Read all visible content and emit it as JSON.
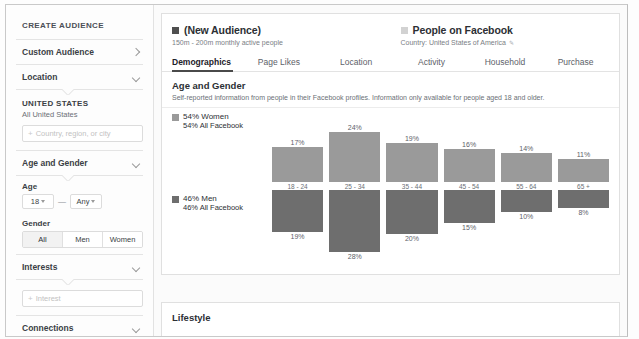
{
  "sidebar": {
    "title": "CREATE AUDIENCE",
    "accordions": [
      {
        "label": "Custom Audience",
        "icon": "chevron-right-icon"
      },
      {
        "label": "Location",
        "icon": "chevron-down-icon"
      }
    ],
    "location": {
      "heading": "UNITED STATES",
      "subtext": "All United States",
      "input_placeholder": "Country, region, or city",
      "add_icon": "plus-icon"
    },
    "age_gender": {
      "label": "Age and Gender",
      "icon": "chevron-down-icon",
      "age_label": "Age",
      "age_min": "18",
      "age_max": "Any",
      "age_separator": "—",
      "gender_label": "Gender",
      "gender_options": [
        "All",
        "Men",
        "Women"
      ],
      "gender_selected": "All"
    },
    "interests": {
      "label": "Interests",
      "icon": "chevron-down-icon",
      "input_placeholder": "Interest",
      "add_icon": "plus-icon"
    },
    "connections": {
      "label": "Connections",
      "icon": "chevron-down-icon"
    },
    "pages": {
      "label": "Pages",
      "icon": "chevron-down-icon"
    }
  },
  "header": {
    "audience": {
      "name": "(New Audience)",
      "subtitle": "150m - 200m monthly active people",
      "swatch_color": "#4f4f4f"
    },
    "comparison": {
      "name": "People on Facebook",
      "subtitle": "Country: United States of America",
      "edit_icon": "pencil-icon",
      "swatch_color": "#d2d2d2"
    }
  },
  "tabs": [
    {
      "label": "Demographics",
      "active": true
    },
    {
      "label": "Page Likes",
      "active": false
    },
    {
      "label": "Location",
      "active": false
    },
    {
      "label": "Activity",
      "active": false
    },
    {
      "label": "Household",
      "active": false
    },
    {
      "label": "Purchase",
      "active": false
    }
  ],
  "section": {
    "title": "Age and Gender",
    "description": "Self-reported information from people in their Facebook profiles. Information only available for people aged 18 and older."
  },
  "legend": {
    "women": {
      "main": "54% Women",
      "sub": "54% All Facebook",
      "color": "#9a9a9a"
    },
    "men": {
      "main": "46% Men",
      "sub": "46% All Facebook",
      "color": "#6e6e6e"
    }
  },
  "next_section": {
    "title": "Lifestyle"
  },
  "chart_data": {
    "type": "bar",
    "title": "Age and Gender",
    "xlabel": "",
    "ylabel": "",
    "grid": false,
    "legend_position": "left",
    "categories": [
      "18 - 24",
      "25 - 34",
      "35 - 44",
      "45 - 54",
      "55 - 64",
      "65 +"
    ],
    "series": [
      {
        "name": "54% Women",
        "color": "#9a9a9a",
        "direction": "up",
        "values": [
          17,
          24,
          19,
          16,
          14,
          11
        ],
        "labels": [
          "17%",
          "24%",
          "19%",
          "16%",
          "14%",
          "11%"
        ]
      },
      {
        "name": "46% Men",
        "color": "#6e6e6e",
        "direction": "down",
        "values": [
          19,
          28,
          20,
          15,
          10,
          8
        ],
        "labels": [
          "19%",
          "28%",
          "20%",
          "15%",
          "10%",
          "8%"
        ]
      }
    ],
    "ylim": [
      0,
      30
    ]
  }
}
